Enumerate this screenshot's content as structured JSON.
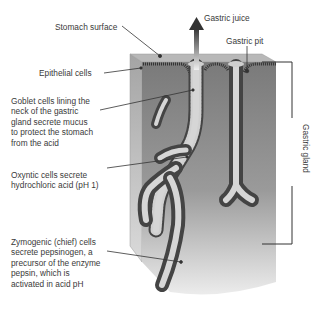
{
  "diagram": {
    "labels": {
      "gastric_juice": "Gastric juice",
      "stomach_surface": "Stomach surface",
      "gastric_pit": "Gastric pit",
      "epithelial_cells": "Epithelial cells",
      "goblet_cells": [
        "Goblet cells lining the",
        "neck of the gastric",
        "gland secrete mucus",
        "to protect the stomach",
        "from the acid"
      ],
      "oxyntic_cells": [
        "Oxyntic cells secrete",
        "hydrochloric acid (pH 1)"
      ],
      "zymogenic_cells": [
        "Zymogenic (chief) cells",
        "secrete pepsinogen, a",
        "precursor of the enzyme",
        "pepsin, which is",
        "activated in acid pH"
      ],
      "gastric_gland": "Gastric gland"
    },
    "colors": {
      "tissue_dark": "#7d7d7d",
      "tissue_light": "#e6e6e6",
      "top_surface": "#b4b4b4",
      "side_face": "#a8a8a8",
      "lumen": "#d2d2d2",
      "line": "#333333"
    }
  }
}
